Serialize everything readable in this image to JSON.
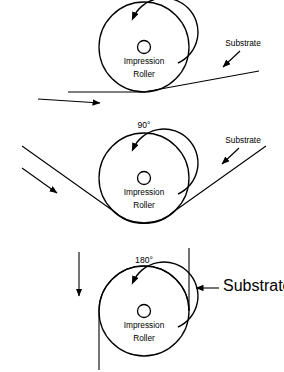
{
  "figure": {
    "ink": "#000000",
    "background": "#ffffff"
  },
  "panels": [
    {
      "id": "panel-zero-degree",
      "angle_label": "",
      "roller_label_line1": "Impression",
      "roller_label_line2": "Roller",
      "substrate_label": "Substrate",
      "wrap_degrees": 0,
      "rotation": "counterclockwise",
      "travel_direction": "left-to-right",
      "roller": {
        "cx": 144,
        "cy": 47,
        "r": 45,
        "hub_r": 6.5
      }
    },
    {
      "id": "panel-ninety-degree",
      "angle_label": "90°",
      "roller_label_line1": "Impression",
      "roller_label_line2": "Roller",
      "substrate_label": "Substrate",
      "wrap_degrees": 90,
      "rotation": "counterclockwise",
      "travel_direction": "right-to-left-descending",
      "roller": {
        "cx": 144,
        "cy": 178,
        "r": 45,
        "hub_r": 6.5
      }
    },
    {
      "id": "panel-one-eighty-degree",
      "angle_label": "180°",
      "roller_label_line1": "Impression",
      "roller_label_line2": "Roller",
      "substrate_label": "Substrate",
      "wrap_degrees": 180,
      "rotation": "counterclockwise",
      "travel_direction": "right-to-left-then-down",
      "roller": {
        "cx": 144,
        "cy": 311,
        "r": 45,
        "hub_r": 6.5
      }
    }
  ]
}
